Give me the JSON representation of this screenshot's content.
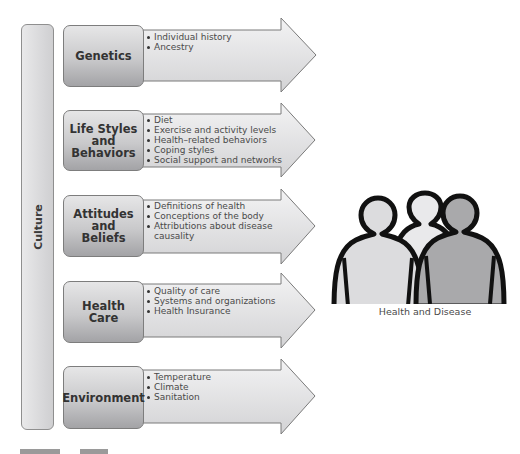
{
  "diagram": {
    "culture_label": "Culture",
    "rows": [
      {
        "label": "Genetics",
        "bullets": [
          "Individual history",
          "Ancestry"
        ]
      },
      {
        "label": "Life Styles\nand\nBehaviors",
        "bullets": [
          "Diet",
          "Exercise and activity levels",
          "Health–related behaviors",
          "Coping styles",
          "Social support and networks"
        ]
      },
      {
        "label": "Attitudes\nand\nBeliefs",
        "bullets": [
          "Definitions of health",
          "Conceptions of the body",
          "Attributions about disease",
          "causality"
        ]
      },
      {
        "label": "Health Care",
        "bullets": [
          "Quality of care",
          "Systems and organizations",
          "Health Insurance"
        ]
      },
      {
        "label": "Environment",
        "bullets": [
          "Temperature",
          "Climate",
          "Sanitation"
        ]
      }
    ],
    "outcome": {
      "icon": "people-group-icon",
      "caption": "Health and Disease"
    }
  },
  "colors": {
    "arrow_fill_light": "#f2f2f3",
    "arrow_fill_dark": "#d6d6d8",
    "arrow_stroke": "#7a7a7a",
    "person_left": "#dcdcde",
    "person_middle": "#e9e9eb",
    "person_right": "#a9a9ab",
    "outline": "#111111"
  }
}
